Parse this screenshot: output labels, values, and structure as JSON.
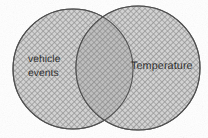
{
  "diagram": {
    "type": "venn",
    "title": "",
    "background_color": "#ffffff",
    "canvas": {
      "width": 208,
      "height": 138
    },
    "sets": [
      {
        "id": "left",
        "label_lines": [
          "vehicle",
          "events"
        ],
        "label_text": "vehicle events",
        "center_x": 73,
        "center_y": 69,
        "radius": 60,
        "fill_color": "#b5b5b5",
        "stroke_color": "#4a4a4a",
        "hatch": "cross-hatch-45"
      },
      {
        "id": "right",
        "label_lines": [
          "Temperature"
        ],
        "label_text": "Temperature",
        "center_x": 138,
        "center_y": 68,
        "radius": 62,
        "fill_color": "#b5b5b5",
        "stroke_color": "#4a4a4a",
        "hatch": "cross-hatch-45"
      }
    ],
    "intersection": {
      "label": "",
      "fill_color": "#9a9a9a",
      "description": "overlap region darker from double hatching"
    },
    "text_color": "#262626"
  }
}
